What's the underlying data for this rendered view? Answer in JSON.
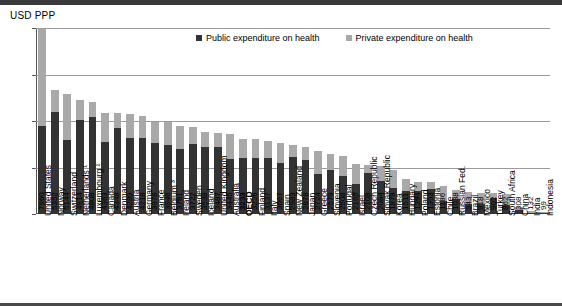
{
  "axis_title": "USD PPP",
  "legend": {
    "public_label": "Public expenditure on health",
    "private_label": "Private expenditure on health",
    "public_color": "#333333",
    "private_color": "#a9a9a9"
  },
  "chart_data": {
    "type": "bar",
    "subtype": "stacked-bar",
    "title": "",
    "xlabel": "",
    "ylabel": "USD PPP",
    "ylim": [
      0,
      8000
    ],
    "yticks": [
      0,
      2000,
      4000,
      6000,
      8000
    ],
    "grid": true,
    "legend_position": "top-center",
    "categories": [
      "United States",
      "Norway",
      "Switzerland",
      "Netherlands ¹",
      "Luxembourg ²",
      "Canada",
      "Denmark",
      "Austria",
      "Germany",
      "France",
      "Belgium ³",
      "Ireland",
      "Sweden",
      "Iceland",
      "United Kingdom",
      "Australia",
      "OECD",
      "Finland",
      "Italy",
      "Spain",
      "New Zealand",
      "Japan",
      "Greece",
      "Slovenia",
      "Portugal",
      "Israel",
      "Czech Republic",
      "Slovak Republic",
      "Korea",
      "Hungary",
      "Poland",
      "Estonia",
      "Chile",
      "Russian Fed.",
      "Brazil",
      "Mexico",
      "Turkey",
      "South Africa",
      "China",
      "India",
      "Indonesia"
    ],
    "totals": [
      7960,
      5352,
      5144,
      4914,
      4808,
      4363,
      4348,
      4289,
      4218,
      3978,
      3946,
      3781,
      3722,
      3538,
      3487,
      3445,
      3233,
      3226,
      3137,
      3067,
      2983,
      2878,
      2724,
      2579,
      2508,
      2165,
      2108,
      2084,
      1879,
      1511,
      1394,
      1393,
      1186,
      1038,
      943,
      918,
      902,
      862,
      308,
      132,
      99
    ],
    "series": [
      {
        "name": "Public expenditure on health",
        "values": [
          3800,
          4400,
          3180,
          4030,
          4180,
          3080,
          3710,
          3270,
          3250,
          3060,
          2950,
          2790,
          3000,
          2900,
          2890,
          2350,
          2420,
          2420,
          2410,
          2210,
          2440,
          2330,
          1720,
          1890,
          1650,
          1300,
          1760,
          1400,
          1130,
          1010,
          980,
          1080,
          560,
          630,
          450,
          450,
          680,
          390,
          160,
          40,
          35
        ]
      },
      {
        "name": "Private expenditure on health",
        "values": [
          4160,
          952,
          1964,
          884,
          628,
          1283,
          638,
          1019,
          968,
          918,
          996,
          991,
          722,
          638,
          597,
          1095,
          813,
          806,
          727,
          857,
          543,
          548,
          1004,
          689,
          858,
          865,
          348,
          684,
          749,
          501,
          414,
          313,
          626,
          408,
          493,
          468,
          222,
          472,
          148,
          92,
          64
        ]
      }
    ],
    "highlighted_category": "OECD",
    "footnote_markers": {
      "Netherlands": "1",
      "Luxembourg": "2",
      "Belgium": "3"
    }
  }
}
